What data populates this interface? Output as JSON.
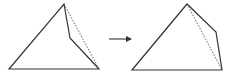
{
  "diagram": {
    "stroke_color": "#333333",
    "dotted_color": "#555555",
    "left_figure": {
      "solid_polygon": [
        [
          9,
          69
        ],
        [
          64,
          4
        ],
        [
          70,
          38
        ],
        [
          99,
          69
        ]
      ],
      "dotted_segment": [
        [
          64,
          4
        ],
        [
          99,
          69
        ]
      ]
    },
    "arrow": {
      "from": [
        109,
        39
      ],
      "to": [
        131,
        39
      ],
      "glyph": "right-arrow"
    },
    "right_figure": {
      "solid_polygon": [
        [
          132,
          70
        ],
        [
          187,
          4
        ],
        [
          216,
          32
        ],
        [
          222,
          70
        ]
      ],
      "dotted_segment": [
        [
          187,
          4
        ],
        [
          222,
          70
        ]
      ]
    }
  }
}
